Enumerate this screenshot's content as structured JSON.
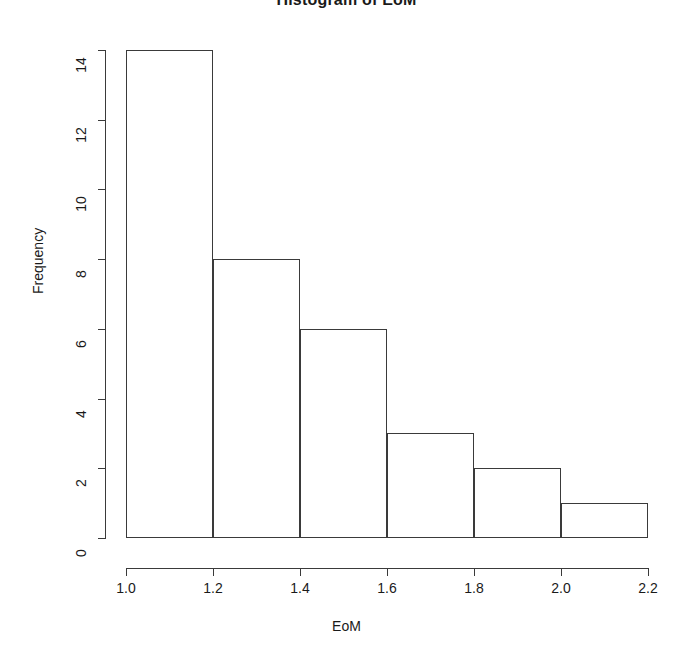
{
  "chart_data": {
    "type": "bar",
    "title": "Histogram of EoM",
    "xlabel": "EoM",
    "ylabel": "Frequency",
    "categories": [
      "1.0-1.2",
      "1.2-1.4",
      "1.4-1.6",
      "1.6-1.8",
      "1.8-2.0",
      "2.0-2.2"
    ],
    "bin_edges": [
      1.0,
      1.2,
      1.4,
      1.6,
      1.8,
      2.0,
      2.2
    ],
    "values": [
      14,
      8,
      6,
      3,
      2,
      1
    ],
    "xlim": [
      1.0,
      2.2
    ],
    "ylim": [
      0,
      14
    ],
    "xticks": [
      "1.0",
      "1.2",
      "1.4",
      "1.6",
      "1.8",
      "2.0",
      "2.2"
    ],
    "xtick_values": [
      1.0,
      1.2,
      1.4,
      1.6,
      1.8,
      2.0,
      2.2
    ],
    "yticks": [
      "0",
      "2",
      "4",
      "6",
      "8",
      "10",
      "12",
      "14"
    ],
    "ytick_values": [
      0,
      2,
      4,
      6,
      8,
      10,
      12,
      14
    ],
    "grid": false,
    "legend": false,
    "bar_fill": "#ffffff",
    "bar_border": "#3a3a3a",
    "axis_color": "#3a3a3a",
    "background": "#ffffff",
    "text_color": "#1a1a1a"
  }
}
